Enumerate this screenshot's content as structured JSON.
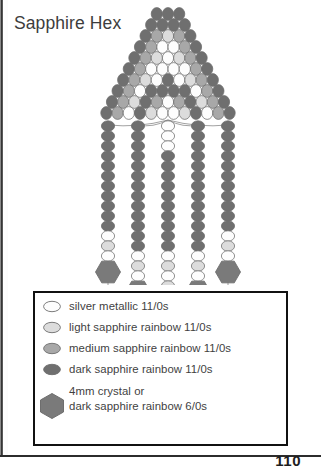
{
  "page": {
    "title": "Sapphire Hex",
    "number": "110"
  },
  "colors": {
    "silver_metallic": "#fdfdfd",
    "light_sapphire": "#dcdcdc",
    "medium_sapphire": "#a8a8a8",
    "dark_sapphire": "#6f6f6f",
    "hex_bead": "#7a7a7a",
    "outline": "#6e6e6e",
    "thread": "#8a8a8a",
    "frame": "#111111",
    "text": "#3f3f3f"
  },
  "legend": {
    "items": [
      {
        "swatch": "seed-bead-silver-metallic",
        "shape": "oval",
        "color_key": "silver_metallic",
        "label": "silver metallic 11/0s"
      },
      {
        "swatch": "seed-bead-light-sapphire",
        "shape": "oval",
        "color_key": "light_sapphire",
        "label": "light sapphire rainbow 11/0s"
      },
      {
        "swatch": "seed-bead-medium-sapphire",
        "shape": "oval",
        "color_key": "medium_sapphire",
        "label": "medium sapphire rainbow 11/0s"
      },
      {
        "swatch": "seed-bead-dark-sapphire",
        "shape": "oval",
        "color_key": "dark_sapphire",
        "label": "dark sapphire rainbow 11/0s"
      },
      {
        "swatch": "hex-crystal-bead",
        "shape": "hexagon",
        "color_key": "hex_bead",
        "label": "4mm crystal or\ndark sapphire rainbow 6/0s"
      }
    ]
  },
  "beadwork": {
    "description": "brick-stitch triangular sapphire motif with five beaded fringe strands",
    "body_rows": [
      {
        "y": 14,
        "count": 3,
        "colors": [
          "d",
          "d",
          "d"
        ]
      },
      {
        "y": 25,
        "count": 4,
        "colors": [
          "d",
          "d",
          "d",
          "d"
        ]
      },
      {
        "y": 36,
        "count": 5,
        "colors": [
          "d",
          "m",
          "l",
          "m",
          "d"
        ]
      },
      {
        "y": 47,
        "count": 6,
        "colors": [
          "d",
          "m",
          "s",
          "s",
          "m",
          "d"
        ]
      },
      {
        "y": 58,
        "count": 7,
        "colors": [
          "d",
          "m",
          "l",
          "s",
          "l",
          "m",
          "d"
        ]
      },
      {
        "y": 69,
        "count": 8,
        "colors": [
          "d",
          "m",
          "s",
          "s",
          "s",
          "s",
          "m",
          "d"
        ]
      },
      {
        "y": 80,
        "count": 9,
        "colors": [
          "d",
          "m",
          "l",
          "s",
          "d",
          "s",
          "l",
          "m",
          "d"
        ]
      },
      {
        "y": 91,
        "count": 10,
        "colors": [
          "d",
          "m",
          "s",
          "d",
          "d",
          "d",
          "d",
          "s",
          "m",
          "d"
        ]
      },
      {
        "y": 102,
        "count": 11,
        "colors": [
          "d",
          "m",
          "l",
          "d",
          "m",
          "s",
          "m",
          "d",
          "l",
          "m",
          "d"
        ]
      },
      {
        "y": 113,
        "count": 12,
        "colors": [
          "d",
          "m",
          "s",
          "d",
          "l",
          "s",
          "s",
          "l",
          "d",
          "s",
          "m",
          "d"
        ]
      }
    ],
    "fringe_strands": [
      {
        "name": "fringe-strand-1",
        "x": 108,
        "top": 126,
        "seeds": [
          "d",
          "d",
          "d",
          "d",
          "d",
          "d",
          "d",
          "d",
          "d",
          "d",
          "d",
          "s",
          "l",
          "s"
        ],
        "hex": true,
        "loop": true
      },
      {
        "name": "fringe-strand-2",
        "x": 138,
        "top": 126,
        "seeds": [
          "d",
          "d",
          "d",
          "d",
          "d",
          "d",
          "d",
          "d",
          "d",
          "d",
          "d",
          "d",
          "d",
          "s",
          "l",
          "s"
        ],
        "hex": true,
        "loop": true
      },
      {
        "name": "fringe-strand-3",
        "x": 168,
        "top": 126,
        "seeds": [
          "s",
          "s",
          "s",
          "d",
          "d",
          "d",
          "d",
          "d",
          "d",
          "d",
          "d",
          "d",
          "d",
          "s",
          "l",
          "s",
          "l"
        ],
        "hex": true,
        "loop": true
      },
      {
        "name": "fringe-strand-4",
        "x": 198,
        "top": 126,
        "seeds": [
          "d",
          "d",
          "d",
          "d",
          "d",
          "d",
          "d",
          "d",
          "d",
          "d",
          "d",
          "d",
          "d",
          "s",
          "l",
          "s"
        ],
        "hex": true,
        "loop": true
      },
      {
        "name": "fringe-strand-5",
        "x": 228,
        "top": 126,
        "seeds": [
          "d",
          "d",
          "d",
          "d",
          "d",
          "d",
          "d",
          "d",
          "d",
          "d",
          "d",
          "s",
          "l",
          "s"
        ],
        "hex": true,
        "loop": true
      }
    ]
  }
}
